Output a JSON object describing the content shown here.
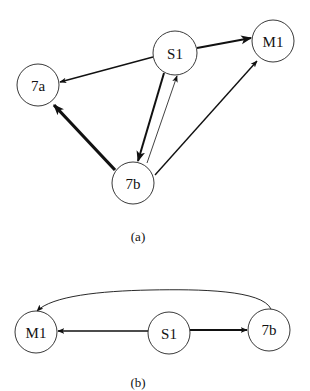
{
  "diagram_a": {
    "caption": "(a)",
    "nodes": [
      {
        "id": "S1",
        "label": "S1",
        "cx": 175,
        "cy": 53,
        "r": 22
      },
      {
        "id": "M1",
        "label": "M1",
        "cx": 273,
        "cy": 41,
        "r": 21
      },
      {
        "id": "7a",
        "label": "7a",
        "cx": 38,
        "cy": 85,
        "r": 21
      },
      {
        "id": "7b",
        "label": "7b",
        "cx": 133,
        "cy": 183,
        "r": 21
      }
    ],
    "edges": [
      {
        "from": "S1",
        "to": "M1",
        "weight": "thick"
      },
      {
        "from": "S1",
        "to": "7a",
        "weight": "medium"
      },
      {
        "from": "S1",
        "to": "7b",
        "weight": "thick"
      },
      {
        "from": "7b",
        "to": "S1",
        "weight": "thin"
      },
      {
        "from": "7b",
        "to": "7a",
        "weight": "very-thick"
      },
      {
        "from": "7b",
        "to": "M1",
        "weight": "medium"
      }
    ]
  },
  "diagram_b": {
    "caption": "(b)",
    "nodes": [
      {
        "id": "M1",
        "label": "M1",
        "cx": 36,
        "cy": 332,
        "r": 21
      },
      {
        "id": "S1",
        "label": "S1",
        "cx": 169,
        "cy": 333,
        "r": 21
      },
      {
        "id": "7b",
        "label": "7b",
        "cx": 269,
        "cy": 330,
        "r": 21
      }
    ],
    "edges": [
      {
        "from": "S1",
        "to": "M1",
        "weight": "medium"
      },
      {
        "from": "S1",
        "to": "7b",
        "weight": "thick"
      },
      {
        "from": "7b",
        "to": "M1",
        "weight": "thin",
        "curved": true
      }
    ]
  }
}
